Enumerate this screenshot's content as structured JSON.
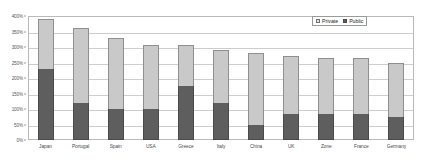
{
  "chart_data": {
    "type": "bar",
    "stacked": true,
    "title": "",
    "xlabel": "",
    "ylabel": "",
    "ylim": [
      0,
      400
    ],
    "ytick_values": [
      0,
      50,
      100,
      150,
      200,
      250,
      300,
      350,
      400
    ],
    "ytick_labels": [
      "0%",
      "50%",
      "100%",
      "150%",
      "200%",
      "250%",
      "300%",
      "350%",
      "400%"
    ],
    "grid": true,
    "legend_position": "top-right",
    "categories": [
      "Japan",
      "Portugal",
      "Spain",
      "USA",
      "Greece",
      "Italy",
      "China",
      "UK",
      "Zone",
      "France",
      "Germany"
    ],
    "series": [
      {
        "name": "Public",
        "color": "#5e5e5e",
        "values": [
          230,
          120,
          100,
          100,
          175,
          120,
          50,
          85,
          85,
          85,
          75
        ]
      },
      {
        "name": "Private",
        "color": "#c9c9c9",
        "values": [
          160,
          240,
          230,
          205,
          130,
          170,
          230,
          185,
          180,
          180,
          175
        ]
      }
    ],
    "totals": [
      390,
      360,
      330,
      305,
      305,
      290,
      280,
      270,
      265,
      265,
      250
    ]
  },
  "legend": {
    "entries": [
      {
        "label": "Private",
        "swatch": "private-swatch"
      },
      {
        "label": "Public",
        "swatch": "public-swatch"
      }
    ]
  }
}
